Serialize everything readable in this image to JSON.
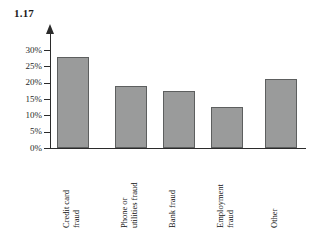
{
  "figure": {
    "number": "1.17"
  },
  "chart_data": {
    "type": "bar",
    "title": "1.17",
    "xlabel": "",
    "ylabel": "",
    "categories": [
      "Credit card\nfraud",
      "Phone or\nutilities fraud",
      "Bank fraud",
      "Employment\nfraud",
      "Other"
    ],
    "values": [
      28,
      19,
      17.5,
      12.5,
      21
    ],
    "value_labels": [
      "28%",
      "19%",
      "17.5%",
      "12.5%",
      "21%"
    ],
    "ylim": [
      0,
      30
    ],
    "ytick_values": [
      0,
      5,
      10,
      15,
      20,
      25,
      30
    ],
    "ytick_labels": [
      "0%",
      "5%",
      "10%",
      "15%",
      "20%",
      "25%",
      "30%"
    ],
    "grid": false,
    "legend": null,
    "bar_color": "#9a9b9b",
    "bar_edge_color": "#5d5f5f",
    "axis_color": "#2b2b2b",
    "background": "#ffffff"
  }
}
